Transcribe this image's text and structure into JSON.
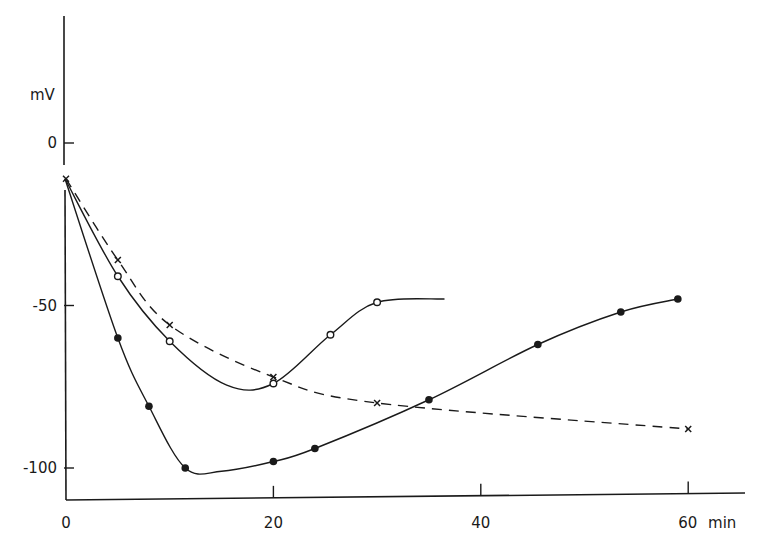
{
  "chart_data": {
    "type": "line",
    "title": "",
    "xlabel": "min",
    "ylabel": "mV",
    "xlim": [
      0,
      66
    ],
    "ylim": [
      -110,
      40
    ],
    "x_ticks": [
      0,
      20,
      40,
      60
    ],
    "x_tick_labels": [
      "0",
      "20",
      "40",
      "60 min"
    ],
    "y_ticks": [
      0,
      -50,
      -100
    ],
    "y_tick_labels": [
      "0",
      "-50",
      "-100"
    ],
    "grid": false,
    "legend": null,
    "series": [
      {
        "name": "crosses (dashed)",
        "marker": "x",
        "line_style": "dashed",
        "x": [
          0,
          5,
          10,
          20,
          30,
          60
        ],
        "y": [
          -11,
          -36,
          -56,
          -72,
          -80,
          -88
        ]
      },
      {
        "name": "open circles",
        "marker": "open-circle",
        "line_style": "solid",
        "x": [
          5,
          10,
          20,
          25.5,
          30
        ],
        "y": [
          -41,
          -61,
          -74,
          -59,
          -49
        ],
        "curve_end": [
          36.5,
          -48
        ]
      },
      {
        "name": "filled circles",
        "marker": "filled-circle",
        "line_style": "solid",
        "x": [
          5,
          8,
          11.5,
          20,
          24,
          35,
          45.5,
          53.5,
          59
        ],
        "y": [
          -60,
          -81,
          -100,
          -98,
          -94,
          -79,
          -62,
          -52,
          -48
        ]
      }
    ]
  },
  "axes": {
    "y_unit": "mV",
    "x_unit": "min"
  }
}
